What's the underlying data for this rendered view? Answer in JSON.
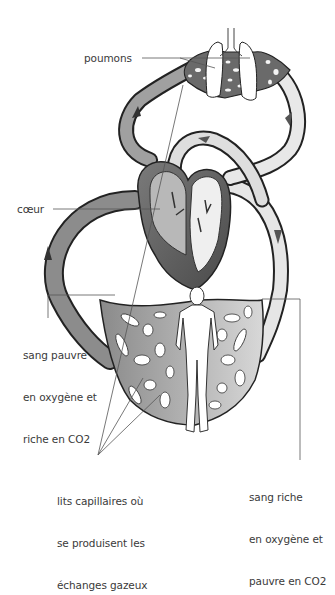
{
  "labels": {
    "lungs": "poumons",
    "heart": "cœur",
    "deoxygenated": [
      "sang pauvre",
      "en oxygène et",
      "riche en CO2"
    ],
    "oxygenated": [
      "sang riche",
      "en oxygène et",
      "pauvre en CO2"
    ],
    "capillaries": [
      "lits capillaires où",
      "se produisent les",
      "échanges gazeux"
    ]
  },
  "colors": {
    "dark_blood": "#4a4a4a",
    "light_blood": "#d6d6d6",
    "vessel_mid": "#9a9a9a",
    "outline": "#222222",
    "leader_line": "#555555"
  },
  "parts": [
    "lungs",
    "trachea",
    "heart",
    "pulmonary-circuit",
    "systemic-circuit",
    "body-capillary-bed",
    "human-figure"
  ]
}
